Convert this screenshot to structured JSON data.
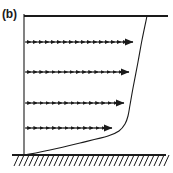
{
  "figure": {
    "panel_label": "(b)",
    "type": "boundary-layer-velocity-profile-diagram",
    "stroke_color": "#1a1a1a",
    "background_color": "#ffffff",
    "width": 173,
    "height": 173
  },
  "chart_data": {
    "type": "line",
    "title": "(b)",
    "subtitle": "",
    "xlabel": "",
    "ylabel": "",
    "xlim": [
      0,
      173
    ],
    "ylim": [
      173,
      0
    ],
    "grid": false,
    "legend": null,
    "annotations": [
      {
        "text": "(b)",
        "x": 3,
        "y": 10
      }
    ],
    "elements": {
      "top_boundary_line": {
        "x1": 24,
        "y1": 16,
        "x2": 168,
        "y2": 16
      },
      "vertical_axis": {
        "x1": 24,
        "y1": 14,
        "x2": 24,
        "y2": 155
      },
      "ground_line": {
        "x1": 12,
        "y1": 155,
        "x2": 166,
        "y2": 155
      },
      "hatch": {
        "count": 31,
        "x_start": 14,
        "x_end": 164,
        "y_top": 155,
        "y_bottom": 166,
        "dx": 5,
        "slant": "forward"
      }
    },
    "velocity_rows": [
      {
        "name": "row-1",
        "y": 42,
        "x_start": 25,
        "x_tip": 133,
        "n_glyphs": 18
      },
      {
        "name": "row-2",
        "y": 72,
        "x_start": 25,
        "x_tip": 129,
        "n_glyphs": 17
      },
      {
        "name": "row-3",
        "y": 103,
        "x_start": 25,
        "x_tip": 124,
        "n_glyphs": 16
      },
      {
        "name": "row-4",
        "y": 128,
        "x_start": 25,
        "x_tip": 112,
        "n_glyphs": 14
      }
    ],
    "profile_curve": {
      "name": "velocity-profile",
      "description": "Boundary layer profile: near-linear outer slope from top boundary down to a sharp knee, then steep drop to the wall",
      "points": [
        {
          "x": 147,
          "y": 16
        },
        {
          "x": 142,
          "y": 40
        },
        {
          "x": 138,
          "y": 62
        },
        {
          "x": 133,
          "y": 88
        },
        {
          "x": 130,
          "y": 105
        },
        {
          "x": 128,
          "y": 116
        },
        {
          "x": 125,
          "y": 124
        },
        {
          "x": 119,
          "y": 131
        },
        {
          "x": 108,
          "y": 136
        },
        {
          "x": 80,
          "y": 143
        },
        {
          "x": 50,
          "y": 150
        },
        {
          "x": 25,
          "y": 155
        }
      ]
    }
  }
}
